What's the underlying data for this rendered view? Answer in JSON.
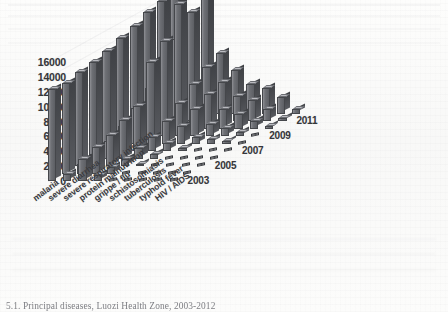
{
  "figure": {
    "caption": "5.1. Principal diseases, Luozi Health Zone, 2003-2012"
  },
  "axes": {
    "y_ticks": [
      "16000",
      "14000",
      "12000",
      "10000",
      "8000",
      "6000",
      "4000",
      "2000",
      "0"
    ],
    "year_labels": [
      "2003",
      "2005",
      "2007",
      "2009",
      "2011"
    ]
  },
  "chart_data": {
    "type": "bar",
    "title": "5.1. Principal diseases, Luozi Health Zone, 2003-2012",
    "subtype": "3d-column",
    "xlabel": "",
    "ylabel": "",
    "zlabel": "",
    "ylim": [
      0,
      16000
    ],
    "ytick_step": 2000,
    "grid": true,
    "legend": "none",
    "categories": [
      "malaria",
      "severe diarrhea",
      "severe respiratory infection",
      "protein malnutrition",
      "grippe / flu",
      "schistosomiasis",
      "tuberculosis",
      "typhoid fever",
      "HIV / AIDS"
    ],
    "depth_axis": {
      "name": "year",
      "values": [
        2003,
        2004,
        2005,
        2006,
        2007,
        2008,
        2009,
        2010,
        2011,
        2012
      ],
      "tick_labels": [
        "2003",
        "2005",
        "2007",
        "2009",
        "2011"
      ]
    },
    "series": [
      {
        "name": "2003",
        "values": [
          12400,
          1000,
          3000,
          800,
          150,
          60,
          50,
          40,
          30
        ]
      },
      {
        "name": "2004",
        "values": [
          12200,
          1300,
          3600,
          900,
          200,
          80,
          60,
          50,
          30
        ]
      },
      {
        "name": "2005",
        "values": [
          12600,
          1600,
          4200,
          1000,
          300,
          120,
          90,
          60,
          40
        ]
      },
      {
        "name": "2006",
        "values": [
          13000,
          2400,
          5200,
          1400,
          600,
          200,
          150,
          90,
          50
        ]
      },
      {
        "name": "2007",
        "values": [
          13400,
          3400,
          6000,
          1900,
          1100,
          400,
          250,
          150,
          70
        ]
      },
      {
        "name": "2008",
        "values": [
          14200,
          4800,
          11000,
          3000,
          2400,
          900,
          600,
          300,
          120
        ]
      },
      {
        "name": "2009",
        "values": [
          14800,
          6400,
          12800,
          4400,
          3600,
          1600,
          1100,
          600,
          200
        ]
      },
      {
        "name": "2010",
        "values": [
          15600,
          9000,
          16800,
          6000,
          4600,
          2600,
          2000,
          1000,
          300
        ]
      },
      {
        "name": "2011",
        "values": [
          16200,
          11000,
          14600,
          7200,
          5200,
          3400,
          2800,
          1600,
          450
        ]
      },
      {
        "name": "2012",
        "values": [
          16800,
          12200,
          15800,
          8200,
          5800,
          4000,
          3400,
          2200,
          600
        ]
      }
    ]
  },
  "colors": {
    "bar_front": "#6e7075",
    "bar_side": "#46484c",
    "bar_top": "#babbc0",
    "text": "#35363a",
    "background": "#fbfbfa",
    "gridline": "#9a9ca4"
  }
}
